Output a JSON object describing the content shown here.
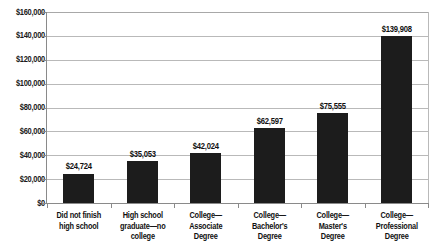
{
  "chart_data": {
    "type": "bar",
    "title": "",
    "subtitle": "",
    "xlabel": "",
    "ylabel": "",
    "ylim": [
      0,
      160000
    ],
    "ytick_step": 20000,
    "grid": true,
    "legend": "none",
    "bar_color": "#1c1c1c",
    "gridline_color": "#b9b9b9",
    "axis_color": "#8a8a8a",
    "categories": [
      "Did not finish high school",
      "High school graduate—no college",
      "College—Associate Degree",
      "College—Bachelor's Degree",
      "College—Master's Degree",
      "College—Professional Degree"
    ],
    "values": [
      24724,
      35053,
      42024,
      62597,
      75555,
      139908
    ],
    "value_labels": [
      "$24,724",
      "$35,053",
      "$42,024",
      "$62,597",
      "$75,555",
      "$139,908"
    ],
    "ytick_labels": [
      "$160,000",
      "$140,000",
      "$120,000",
      "$100,000",
      "$80,000",
      "$60,000",
      "$40,000",
      "$20,000",
      "$0"
    ],
    "ytick_values": [
      160000,
      140000,
      120000,
      100000,
      80000,
      60000,
      40000,
      20000,
      0
    ],
    "category_label_lines": [
      [
        "Did not finish",
        "high school"
      ],
      [
        "High school",
        "graduate—no",
        "college"
      ],
      [
        "College—",
        "Associate",
        "Degree"
      ],
      [
        "College—",
        "Bachelor's",
        "Degree"
      ],
      [
        "College—",
        "Master's",
        "Degree"
      ],
      [
        "College—",
        "Professional",
        "Degree"
      ]
    ]
  }
}
